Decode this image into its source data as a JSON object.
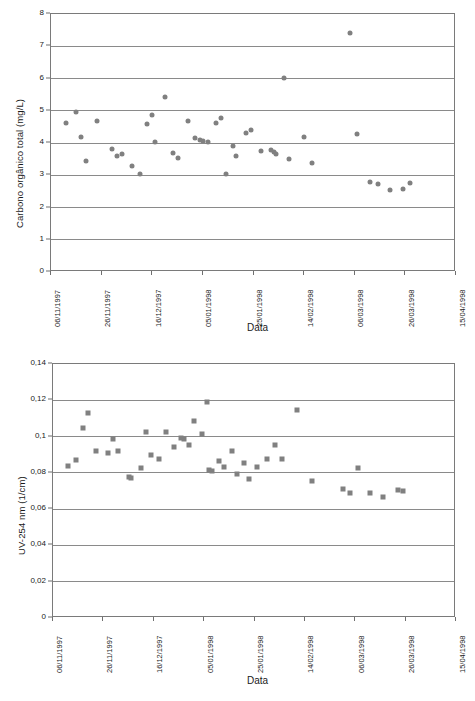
{
  "page": {
    "background": "#ffffff",
    "marker_color": "#808080",
    "axis_color": "#7a7a7a",
    "grid_color": "#8a8a8a"
  },
  "chart_data": [
    {
      "id": "carbono-organico-total",
      "type": "scatter",
      "title": "",
      "xlabel": "Data",
      "ylabel": "Carbono orgânico total (mg/L)",
      "ylim": [
        0,
        8
      ],
      "yticks": [
        0,
        1,
        2,
        3,
        4,
        5,
        6,
        7,
        8
      ],
      "ytick_labels": [
        "0",
        "1",
        "2",
        "3",
        "4",
        "5",
        "6",
        "7",
        "8"
      ],
      "xtick_labels": [
        "06/11/1997",
        "26/11/1997",
        "16/12/1997",
        "05/01/1998",
        "25/01/1998",
        "14/02/1998",
        "06/03/1998",
        "26/03/1998",
        "15/04/1998"
      ],
      "xlim_days": [
        0,
        160
      ],
      "xtick_days": [
        0,
        20,
        40,
        60,
        80,
        100,
        120,
        140,
        160
      ],
      "grid": true,
      "legend": "none",
      "marker": "circle",
      "series": [
        {
          "name": "Carbono orgânico total",
          "points": [
            {
              "x": 6,
              "y": 4.63
            },
            {
              "x": 10,
              "y": 4.95
            },
            {
              "x": 12,
              "y": 4.18
            },
            {
              "x": 14,
              "y": 3.45
            },
            {
              "x": 18,
              "y": 4.68
            },
            {
              "x": 24,
              "y": 3.82
            },
            {
              "x": 26,
              "y": 3.6
            },
            {
              "x": 28,
              "y": 3.66
            },
            {
              "x": 32,
              "y": 3.3
            },
            {
              "x": 35,
              "y": 3.03
            },
            {
              "x": 38,
              "y": 4.58
            },
            {
              "x": 40,
              "y": 4.86
            },
            {
              "x": 41,
              "y": 4.02
            },
            {
              "x": 45,
              "y": 5.43
            },
            {
              "x": 48,
              "y": 3.7
            },
            {
              "x": 50,
              "y": 3.54
            },
            {
              "x": 54,
              "y": 4.67
            },
            {
              "x": 57,
              "y": 4.15
            },
            {
              "x": 59,
              "y": 4.08
            },
            {
              "x": 60,
              "y": 4.05
            },
            {
              "x": 62,
              "y": 4.02
            },
            {
              "x": 65,
              "y": 4.62
            },
            {
              "x": 67,
              "y": 4.78
            },
            {
              "x": 69,
              "y": 3.03
            },
            {
              "x": 72,
              "y": 3.92
            },
            {
              "x": 73,
              "y": 3.59
            },
            {
              "x": 77,
              "y": 4.3
            },
            {
              "x": 79,
              "y": 4.4
            },
            {
              "x": 83,
              "y": 3.75
            },
            {
              "x": 87,
              "y": 3.77
            },
            {
              "x": 88,
              "y": 3.72
            },
            {
              "x": 89,
              "y": 3.65
            },
            {
              "x": 92,
              "y": 6.01
            },
            {
              "x": 94,
              "y": 3.5
            },
            {
              "x": 100,
              "y": 4.18
            },
            {
              "x": 103,
              "y": 3.37
            },
            {
              "x": 118,
              "y": 7.4
            },
            {
              "x": 121,
              "y": 4.27
            },
            {
              "x": 126,
              "y": 2.79
            },
            {
              "x": 129,
              "y": 2.72
            },
            {
              "x": 134,
              "y": 2.54
            },
            {
              "x": 139,
              "y": 2.57
            },
            {
              "x": 142,
              "y": 2.75
            }
          ]
        }
      ]
    },
    {
      "id": "uv-254-nm",
      "type": "scatter",
      "title": "",
      "xlabel": "Data",
      "ylabel": "UV-254 nm (1/cm)",
      "ylim": [
        0,
        0.14
      ],
      "yticks": [
        0,
        0.02,
        0.04,
        0.06,
        0.08,
        0.1,
        0.12,
        0.14
      ],
      "ytick_labels": [
        "0",
        "0,02",
        "0,04",
        "0,06",
        "0,08",
        "0,1",
        "0,12",
        "0,14"
      ],
      "xtick_labels": [
        "06/11/1997",
        "26/11/1997",
        "16/12/1997",
        "05/01/1998",
        "25/01/1998",
        "14/02/1998",
        "06/03/1998",
        "26/03/1998",
        "15/04/1998"
      ],
      "xlim_days": [
        0,
        160
      ],
      "xtick_days": [
        0,
        20,
        40,
        60,
        80,
        100,
        120,
        140,
        160
      ],
      "grid": true,
      "legend": "none",
      "marker": "square",
      "series": [
        {
          "name": "UV-254 nm",
          "points": [
            {
              "x": 6,
              "y": 0.084
            },
            {
              "x": 9,
              "y": 0.087
            },
            {
              "x": 12,
              "y": 0.1047
            },
            {
              "x": 14,
              "y": 0.1128
            },
            {
              "x": 17,
              "y": 0.092
            },
            {
              "x": 22,
              "y": 0.0908
            },
            {
              "x": 24,
              "y": 0.0988
            },
            {
              "x": 26,
              "y": 0.092
            },
            {
              "x": 30,
              "y": 0.0779
            },
            {
              "x": 31,
              "y": 0.0772
            },
            {
              "x": 35,
              "y": 0.0826
            },
            {
              "x": 37,
              "y": 0.1026
            },
            {
              "x": 39,
              "y": 0.0898
            },
            {
              "x": 42,
              "y": 0.0878
            },
            {
              "x": 45,
              "y": 0.1026
            },
            {
              "x": 48,
              "y": 0.094
            },
            {
              "x": 51,
              "y": 0.0994
            },
            {
              "x": 52,
              "y": 0.0986
            },
            {
              "x": 54,
              "y": 0.0956
            },
            {
              "x": 56,
              "y": 0.1088
            },
            {
              "x": 59,
              "y": 0.1012
            },
            {
              "x": 61,
              "y": 0.1188
            },
            {
              "x": 62,
              "y": 0.0816
            },
            {
              "x": 63,
              "y": 0.081
            },
            {
              "x": 66,
              "y": 0.0868
            },
            {
              "x": 68,
              "y": 0.0832
            },
            {
              "x": 71,
              "y": 0.092
            },
            {
              "x": 73,
              "y": 0.0796
            },
            {
              "x": 76,
              "y": 0.0856
            },
            {
              "x": 78,
              "y": 0.0768
            },
            {
              "x": 81,
              "y": 0.083
            },
            {
              "x": 85,
              "y": 0.0878
            },
            {
              "x": 88,
              "y": 0.0956
            },
            {
              "x": 91,
              "y": 0.0878
            },
            {
              "x": 97,
              "y": 0.1148
            },
            {
              "x": 103,
              "y": 0.0756
            },
            {
              "x": 115,
              "y": 0.071
            },
            {
              "x": 118,
              "y": 0.0688
            },
            {
              "x": 121,
              "y": 0.0828
            },
            {
              "x": 126,
              "y": 0.0688
            },
            {
              "x": 131,
              "y": 0.0668
            },
            {
              "x": 137,
              "y": 0.0708
            },
            {
              "x": 139,
              "y": 0.07
            }
          ]
        }
      ]
    }
  ]
}
